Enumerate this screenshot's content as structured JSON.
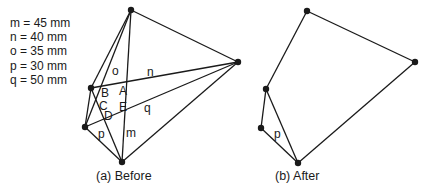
{
  "legend": [
    {
      "text": "m = 45 mm"
    },
    {
      "text": "n = 40 mm"
    },
    {
      "text": "o = 35 mm"
    },
    {
      "text": "p = 30 mm"
    },
    {
      "text": "q = 50 mm"
    }
  ],
  "before": {
    "caption": "(a)  Before",
    "points": {
      "top": [
        131,
        10
      ],
      "right": [
        238,
        62
      ],
      "upper_left": [
        91,
        88
      ],
      "lower_left": [
        85,
        127
      ],
      "bottom": [
        122,
        162
      ]
    },
    "edge_labels": {
      "o": "o",
      "n": "n",
      "q": "q",
      "p": "p",
      "m": "m"
    },
    "intersection_labels": {
      "A": "A",
      "B": "B",
      "C": "C",
      "D": "D",
      "E": "E"
    }
  },
  "after": {
    "caption": "(b)  After",
    "points": {
      "top": [
        307,
        11
      ],
      "right": [
        415,
        62
      ],
      "upper_left": [
        266,
        89
      ],
      "lower_left": [
        261,
        128
      ],
      "bottom": [
        298,
        163
      ]
    },
    "edge_labels": {
      "p": "p"
    }
  }
}
